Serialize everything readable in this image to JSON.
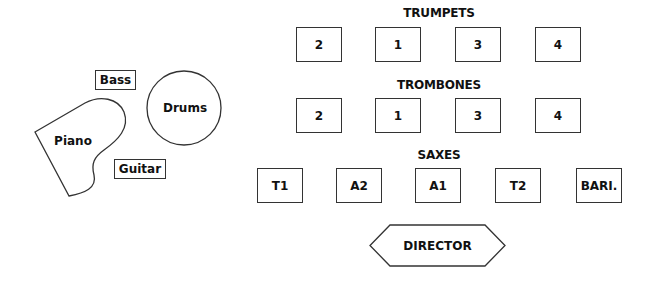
{
  "colors": {
    "stroke": "#333333",
    "text": "#111111",
    "background": "#ffffff"
  },
  "rhythm": {
    "piano": "Piano",
    "drums": "Drums",
    "bass": "Bass",
    "guitar": "Guitar"
  },
  "sections": {
    "trumpets": {
      "label": "TRUMPETS",
      "seats": [
        "2",
        "1",
        "3",
        "4"
      ]
    },
    "trombones": {
      "label": "TROMBONES",
      "seats": [
        "2",
        "1",
        "3",
        "4"
      ]
    },
    "saxes": {
      "label": "SAXES",
      "seats": [
        "T1",
        "A2",
        "A1",
        "T2",
        "BARI."
      ]
    }
  },
  "director": {
    "label": "DIRECTOR"
  }
}
